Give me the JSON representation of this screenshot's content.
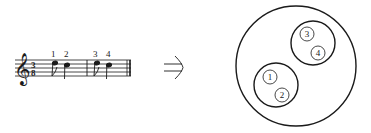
{
  "diagram": {
    "score": {
      "clef": "treble",
      "time_signature": {
        "top": "3",
        "bottom": "8"
      },
      "note_labels": [
        "1",
        "2",
        "3",
        "4"
      ],
      "measures": [
        {
          "notes": [
            "1",
            "2"
          ]
        },
        {
          "notes": [
            "3",
            "4"
          ]
        }
      ]
    },
    "arrow": {
      "symbol": "⇒",
      "meaning": "implies"
    },
    "grouping": {
      "outer": "whole",
      "groups": [
        {
          "members": [
            "3",
            "4"
          ]
        },
        {
          "members": [
            "1",
            "2"
          ]
        }
      ]
    },
    "colors": {
      "ink": "#1a1a1a",
      "background": "#ffffff"
    }
  }
}
